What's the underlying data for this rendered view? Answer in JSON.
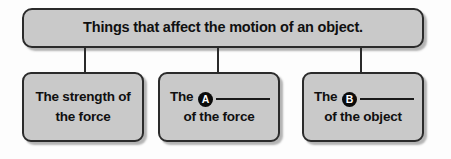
{
  "diagram": {
    "type": "concept-map",
    "root": {
      "label": "Things that affect the motion of an object."
    },
    "children": [
      {
        "id": "child-1",
        "line1": "The strength of",
        "line2": "the force",
        "has_blank": false,
        "marker": null
      },
      {
        "id": "child-2",
        "line1_prefix": "The",
        "marker": "A",
        "blank": "",
        "line2": "of the force",
        "has_blank": true
      },
      {
        "id": "child-3",
        "line1_prefix": "The",
        "marker": "B",
        "blank": "",
        "line2": "of the object",
        "has_blank": true
      }
    ],
    "colors": {
      "box_fill": "#c9c9c9",
      "box_border": "#2b2b2b",
      "text": "#101010",
      "marker_fill": "#0b0b0b",
      "marker_text": "#ffffff",
      "background": "#fdfdfd"
    }
  }
}
